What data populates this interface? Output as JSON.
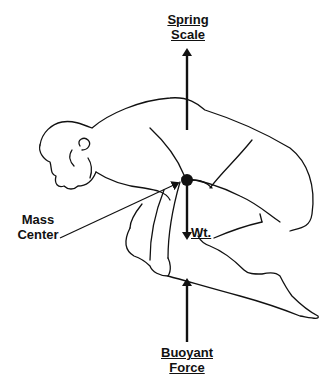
{
  "diagram": {
    "labels": {
      "top_line1": "Spring",
      "top_line2": "Scale",
      "left_line1": "Mass",
      "left_line2": "Center",
      "weight": "Wt.",
      "bottom_line1": "Buoyant",
      "bottom_line2": "Force"
    },
    "colors": {
      "ink": "#111111",
      "background": "#ffffff"
    },
    "arrows": [
      {
        "name": "spring-scale-force",
        "direction": "up"
      },
      {
        "name": "weight-force",
        "direction": "down"
      },
      {
        "name": "buoyant-force",
        "direction": "up"
      },
      {
        "name": "mass-center-pointer",
        "direction": "right"
      }
    ]
  }
}
